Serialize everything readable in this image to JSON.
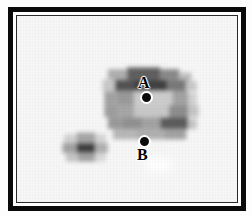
{
  "figure": {
    "title": "",
    "frame": {
      "outer_color": "#0a0a0a",
      "inner_color": "#2b2b2b",
      "background_color": "#f6f6f6"
    }
  },
  "markers": [
    {
      "id": "A",
      "label": "A",
      "label_position": "above",
      "x": 130,
      "y": 82,
      "shape": "filled-circle-white-ring"
    },
    {
      "id": "B",
      "label": "B",
      "label_position": "below",
      "x": 128,
      "y": 126,
      "shape": "filled-circle-white-ring"
    }
  ],
  "chart_data": {
    "type": "heatmap",
    "title": "",
    "xlabel": "",
    "ylabel": "",
    "colormap": "grayscale-inverted",
    "grid": false,
    "legend": "none",
    "cell_size_px": 7.5,
    "origin_px": {
      "x": 16,
      "y": 15
    },
    "nx": 29,
    "ny": 25,
    "value_range": [
      0,
      100
    ],
    "features": [
      {
        "name": "ring-source",
        "bbox_px": [
          104,
          62,
          96,
          78
        ],
        "peak_value": 92
      },
      {
        "name": "compact-source",
        "bbox_px": [
          54,
          138,
          48,
          28
        ],
        "peak_value": 88
      },
      {
        "name": "faint-patch",
        "bbox_px": [
          148,
          166,
          28,
          16
        ],
        "peak_value": 4
      }
    ],
    "cells": [
      {
        "x": 104,
        "y": 62,
        "w": 22,
        "h": 12,
        "v": 34
      },
      {
        "x": 126,
        "y": 60,
        "w": 38,
        "h": 14,
        "v": 72
      },
      {
        "x": 164,
        "y": 62,
        "w": 22,
        "h": 12,
        "v": 52
      },
      {
        "x": 186,
        "y": 66,
        "w": 14,
        "h": 12,
        "v": 26
      },
      {
        "x": 98,
        "y": 74,
        "w": 14,
        "h": 14,
        "v": 22
      },
      {
        "x": 112,
        "y": 74,
        "w": 22,
        "h": 14,
        "v": 78
      },
      {
        "x": 134,
        "y": 74,
        "w": 38,
        "h": 14,
        "v": 86
      },
      {
        "x": 172,
        "y": 74,
        "w": 22,
        "h": 14,
        "v": 60
      },
      {
        "x": 194,
        "y": 76,
        "w": 12,
        "h": 12,
        "v": 22
      },
      {
        "x": 100,
        "y": 88,
        "w": 14,
        "h": 16,
        "v": 40
      },
      {
        "x": 114,
        "y": 88,
        "w": 20,
        "h": 16,
        "v": 44
      },
      {
        "x": 134,
        "y": 88,
        "w": 44,
        "h": 16,
        "v": 20
      },
      {
        "x": 178,
        "y": 88,
        "w": 18,
        "h": 16,
        "v": 40
      },
      {
        "x": 196,
        "y": 90,
        "w": 10,
        "h": 14,
        "v": 18
      },
      {
        "x": 100,
        "y": 104,
        "w": 16,
        "h": 14,
        "v": 42
      },
      {
        "x": 116,
        "y": 104,
        "w": 18,
        "h": 14,
        "v": 38
      },
      {
        "x": 134,
        "y": 104,
        "w": 40,
        "h": 14,
        "v": 22
      },
      {
        "x": 174,
        "y": 104,
        "w": 22,
        "h": 14,
        "v": 50
      },
      {
        "x": 196,
        "y": 104,
        "w": 12,
        "h": 14,
        "v": 24
      },
      {
        "x": 104,
        "y": 118,
        "w": 16,
        "h": 14,
        "v": 44
      },
      {
        "x": 120,
        "y": 118,
        "w": 24,
        "h": 14,
        "v": 48
      },
      {
        "x": 144,
        "y": 118,
        "w": 20,
        "h": 14,
        "v": 40
      },
      {
        "x": 164,
        "y": 118,
        "w": 32,
        "h": 14,
        "v": 74
      },
      {
        "x": 196,
        "y": 120,
        "w": 10,
        "h": 12,
        "v": 24
      },
      {
        "x": 110,
        "y": 132,
        "w": 26,
        "h": 12,
        "v": 30
      },
      {
        "x": 136,
        "y": 132,
        "w": 32,
        "h": 12,
        "v": 34
      },
      {
        "x": 168,
        "y": 132,
        "w": 26,
        "h": 12,
        "v": 40
      },
      {
        "x": 54,
        "y": 138,
        "w": 14,
        "h": 10,
        "v": 18
      },
      {
        "x": 68,
        "y": 136,
        "w": 22,
        "h": 12,
        "v": 38
      },
      {
        "x": 90,
        "y": 138,
        "w": 12,
        "h": 10,
        "v": 16
      },
      {
        "x": 52,
        "y": 148,
        "w": 16,
        "h": 12,
        "v": 40
      },
      {
        "x": 68,
        "y": 148,
        "w": 22,
        "h": 12,
        "v": 86
      },
      {
        "x": 90,
        "y": 148,
        "w": 14,
        "h": 12,
        "v": 34
      },
      {
        "x": 56,
        "y": 160,
        "w": 14,
        "h": 10,
        "v": 24
      },
      {
        "x": 70,
        "y": 160,
        "w": 20,
        "h": 10,
        "v": 40
      },
      {
        "x": 90,
        "y": 160,
        "w": 12,
        "h": 10,
        "v": 14
      },
      {
        "x": 148,
        "y": 166,
        "w": 28,
        "h": 16,
        "v": -5
      }
    ]
  }
}
